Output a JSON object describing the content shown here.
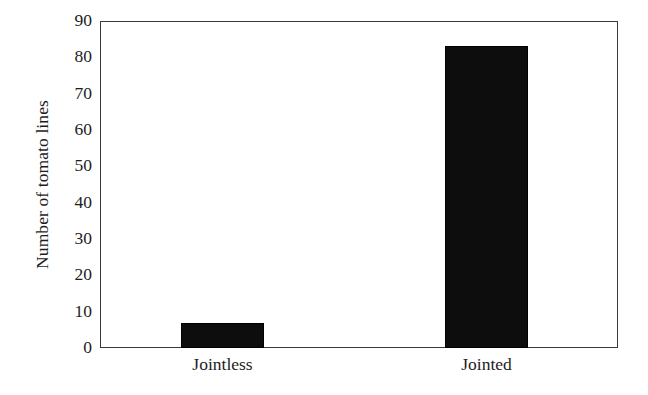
{
  "chart_data": {
    "type": "bar",
    "title": "",
    "subtitle": "",
    "xlabel": "",
    "ylabel": "Number of tomato lines",
    "categories": [
      "Jointless",
      "Jointed"
    ],
    "values": [
      7,
      83
    ],
    "series": [
      {
        "name": "Number of tomato lines",
        "values": [
          7,
          83
        ]
      }
    ],
    "ylim": [
      0,
      90
    ],
    "ytick_labels": [
      "0",
      "10",
      "20",
      "30",
      "40",
      "50",
      "60",
      "70",
      "80",
      "90"
    ],
    "ytick_values": [
      0,
      10,
      20,
      30,
      40,
      50,
      60,
      70,
      80,
      90
    ],
    "ytick_step": 10,
    "grid": false,
    "legend": false,
    "legend_position": "none",
    "bar_color": "#0d0d0d",
    "background_color": "#ffffff",
    "axis_color": "#3a3a3a",
    "frame": "full-rectangle",
    "annotations": []
  },
  "axes": {
    "y_title": "Number of tomato lines"
  }
}
